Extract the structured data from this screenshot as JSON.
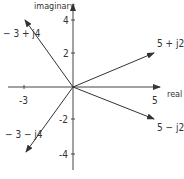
{
  "diagram": {
    "axes": {
      "x_label": "real",
      "y_label": "imaginary",
      "x_ticks": [
        {
          "value": -3,
          "label": "-3"
        },
        {
          "value": 5,
          "label": "5"
        }
      ],
      "y_ticks": [
        {
          "value": 4,
          "label": "4"
        },
        {
          "value": 2,
          "label": "2"
        },
        {
          "value": -2,
          "label": "-2"
        },
        {
          "value": -4,
          "label": "-4"
        }
      ]
    },
    "vectors": [
      {
        "re": -3,
        "im": 4,
        "label": "− 3 + j4"
      },
      {
        "re": 5,
        "im": 2,
        "label": "5 + j2"
      },
      {
        "re": 5,
        "im": -2,
        "label": "5 − j2"
      },
      {
        "re": -3,
        "im": -4,
        "label": "− 3 − j4"
      }
    ]
  }
}
